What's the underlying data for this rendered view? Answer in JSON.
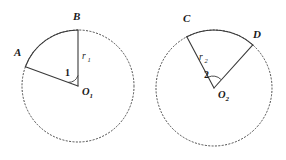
{
  "figure": {
    "background_color": "#ffffff",
    "stroke_color": "#3a3a3a",
    "dashed_stroke_color": "#4a4a4a"
  },
  "left_circle": {
    "center_label": "O",
    "center_subscript": "1",
    "radius_label": "r",
    "radius_subscript": "1",
    "angle_label": "1",
    "arc_start_point": "A",
    "arc_end_point": "B",
    "geometry": {
      "cx": 78,
      "cy": 86,
      "r": 56,
      "arc_start_deg": 160,
      "arc_end_deg": 90
    }
  },
  "right_circle": {
    "center_label": "O",
    "center_subscript": "2",
    "radius_label": "r",
    "radius_subscript": "2",
    "angle_label": "2",
    "arc_start_point": "C",
    "arc_end_point": "D",
    "geometry": {
      "cx": 214,
      "cy": 88,
      "r": 58,
      "arc_start_deg": 118,
      "arc_end_deg": 48
    }
  },
  "labels": {
    "point_a": "A",
    "point_b": "B",
    "point_c": "C",
    "point_d": "D"
  }
}
